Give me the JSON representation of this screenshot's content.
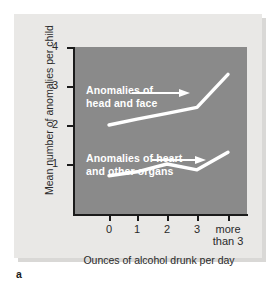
{
  "figure": {
    "caption_letter": "a",
    "background_color": "#e9e8e6",
    "plot_background_color": "#8a8a8a",
    "line_color": "#ffffff",
    "axis_color": "#1b1b1b"
  },
  "chart_data": {
    "type": "line",
    "title": "",
    "xlabel": "Ounces of alcohol drunk per day",
    "ylabel": "Mean number of anomalies per child",
    "categories": [
      "0",
      "1",
      "2",
      "3",
      "more\nthan 3"
    ],
    "x_tick_labels": [
      "0",
      "1",
      "2",
      "3",
      "more\nthan 3"
    ],
    "y_tick_labels": [
      "1",
      "2",
      "3",
      "4"
    ],
    "y_ticks": [
      1,
      2,
      3,
      4
    ],
    "ylim": [
      0,
      4
    ],
    "grid": false,
    "legend_position": "inline-annotations",
    "series": [
      {
        "name": "Anomalies of\nhead and face",
        "label_line1": "Anomalies of",
        "label_line2": "head and face",
        "values": [
          2.0,
          2.15,
          2.3,
          2.45,
          3.3
        ]
      },
      {
        "name": "Anomalies of heart\nand other organs",
        "label_line1": "Anomalies of heart",
        "label_line2": "and other organs",
        "values": [
          0.7,
          0.8,
          1.0,
          0.85,
          1.3
        ]
      }
    ],
    "annotations": [
      {
        "text": "Anomalies of head and face",
        "points_to_series": 0
      },
      {
        "text": "Anomalies of heart and other organs",
        "points_to_series": 1
      }
    ]
  }
}
